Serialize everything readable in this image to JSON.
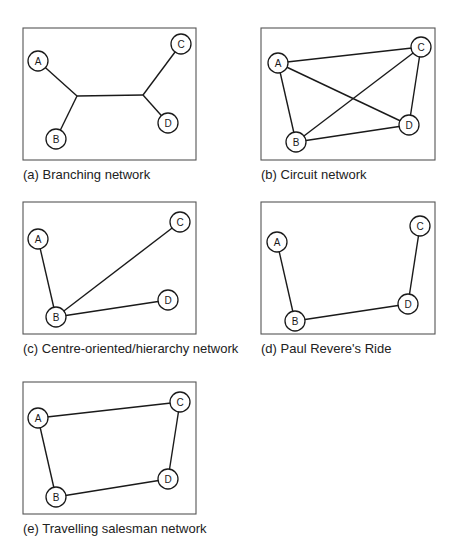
{
  "panels": [
    {
      "id": "a",
      "caption": "(a) Branching network",
      "frame": {
        "x": 23,
        "y": 28,
        "w": 173,
        "h": 132
      },
      "nodes": [
        {
          "label": "A",
          "x": 38,
          "y": 61
        },
        {
          "label": "B",
          "x": 56,
          "y": 139
        },
        {
          "label": "C",
          "x": 181,
          "y": 44
        },
        {
          "label": "D",
          "x": 168,
          "y": 123
        }
      ],
      "junctions": [
        {
          "x": 77,
          "y": 96
        },
        {
          "x": 143,
          "y": 95
        }
      ],
      "edges": [
        [
          "A",
          "J1"
        ],
        [
          "B",
          "J1"
        ],
        [
          "J1",
          "J2"
        ],
        [
          "J2",
          "C"
        ],
        [
          "J2",
          "D"
        ]
      ]
    },
    {
      "id": "b",
      "caption": "(b) Circuit network",
      "frame": {
        "x": 261,
        "y": 28,
        "w": 174,
        "h": 132
      },
      "nodes": [
        {
          "label": "A",
          "x": 278,
          "y": 63
        },
        {
          "label": "B",
          "x": 296,
          "y": 142
        },
        {
          "label": "C",
          "x": 421,
          "y": 47
        },
        {
          "label": "D",
          "x": 409,
          "y": 125
        }
      ],
      "edges": [
        [
          "A",
          "C"
        ],
        [
          "A",
          "B"
        ],
        [
          "A",
          "D"
        ],
        [
          "B",
          "C"
        ],
        [
          "B",
          "D"
        ],
        [
          "C",
          "D"
        ]
      ]
    },
    {
      "id": "c",
      "caption": "(c) Centre-oriented/hierarchy network",
      "frame": {
        "x": 23,
        "y": 202,
        "w": 173,
        "h": 132
      },
      "nodes": [
        {
          "label": "A",
          "x": 38,
          "y": 239
        },
        {
          "label": "B",
          "x": 56,
          "y": 317
        },
        {
          "label": "C",
          "x": 180,
          "y": 222
        },
        {
          "label": "D",
          "x": 168,
          "y": 300
        }
      ],
      "edges": [
        [
          "A",
          "B"
        ],
        [
          "B",
          "C"
        ],
        [
          "B",
          "D"
        ]
      ]
    },
    {
      "id": "d",
      "caption": "(d) Paul Revere's Ride",
      "frame": {
        "x": 261,
        "y": 202,
        "w": 174,
        "h": 132
      },
      "nodes": [
        {
          "label": "A",
          "x": 277,
          "y": 242
        },
        {
          "label": "B",
          "x": 295,
          "y": 321
        },
        {
          "label": "C",
          "x": 420,
          "y": 226
        },
        {
          "label": "D",
          "x": 408,
          "y": 304
        }
      ],
      "edges": [
        [
          "A",
          "B"
        ],
        [
          "B",
          "D"
        ],
        [
          "D",
          "C"
        ]
      ]
    },
    {
      "id": "e",
      "caption": "(e) Travelling salesman network",
      "frame": {
        "x": 23,
        "y": 382,
        "w": 173,
        "h": 132
      },
      "nodes": [
        {
          "label": "A",
          "x": 38,
          "y": 418
        },
        {
          "label": "B",
          "x": 56,
          "y": 497
        },
        {
          "label": "C",
          "x": 180,
          "y": 402
        },
        {
          "label": "D",
          "x": 168,
          "y": 479
        }
      ],
      "edges": [
        [
          "A",
          "C"
        ],
        [
          "C",
          "D"
        ],
        [
          "D",
          "B"
        ],
        [
          "B",
          "A"
        ]
      ]
    }
  ],
  "style": {
    "node_radius": 10,
    "line_color": "#1a1a1a",
    "frame_color": "#555555"
  }
}
